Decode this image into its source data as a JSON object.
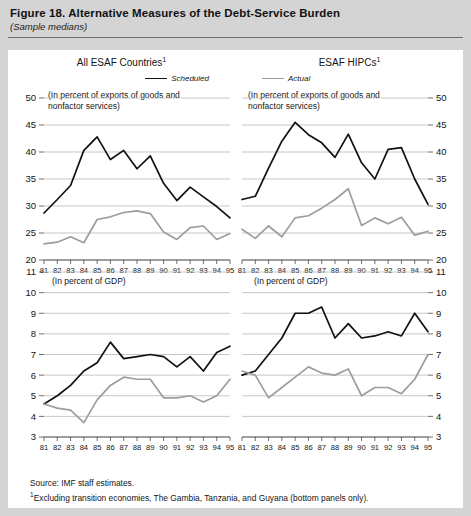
{
  "figure": {
    "title": "Figure 18. Alternative Measures of the Debt-Service Burden",
    "subtitle": "(Sample medians)",
    "source_note": "Source:  IMF staff estimates.",
    "footnote_marker": "1",
    "footnote": "Excluding transition economies, The Gambia, Tanzania, and Guyana (bottom panels only)."
  },
  "colors": {
    "scheduled": "#111111",
    "actual": "#9d9d9d",
    "gridline": "#b9b9b9",
    "page_background": "#d4d4d4",
    "panel_background": "#ffffff"
  },
  "legend": {
    "scheduled_label": "Scheduled",
    "actual_label": "Actual"
  },
  "panels": {
    "top_left": {
      "title": "All ESAF Countries",
      "title_superscript": "1",
      "units": "(In percent of exports of goods and\nnonfactor services)",
      "y_labels_side": "left"
    },
    "top_right": {
      "title": "ESAF HIPCs",
      "title_superscript": "1",
      "units": "(In percent of exports of goods and\nnonfactor services)",
      "y_labels_side": "right"
    },
    "bottom_left": {
      "title": "",
      "units": "(In percent of GDP)",
      "y_labels_side": "left"
    },
    "bottom_right": {
      "title": "",
      "units": "(In percent of GDP)",
      "y_labels_side": "right"
    }
  },
  "chart_data": [
    {
      "id": "top_left",
      "type": "line",
      "title": "All ESAF Countries",
      "subtitle": "(In percent of exports of goods and nonfactor services)",
      "xlabel": "",
      "ylabel": "",
      "x": [
        "81",
        "82",
        "83",
        "84",
        "85",
        "86",
        "87",
        "88",
        "89",
        "90",
        "91",
        "92",
        "93",
        "94",
        "95"
      ],
      "tick_labels": [
        "81",
        "82",
        "83",
        "84",
        "85",
        "86",
        "87",
        "88",
        "89",
        "90",
        "91",
        "92",
        "93",
        "94",
        "95"
      ],
      "ylim": [
        20,
        50
      ],
      "yticks": [
        20,
        25,
        30,
        35,
        40,
        45,
        50
      ],
      "grid": true,
      "legend_position": "top-right",
      "series": [
        {
          "name": "Scheduled",
          "color": "#111111",
          "values": [
            28.7,
            31.2,
            33.8,
            40.3,
            42.8,
            38.6,
            40.3,
            36.9,
            39.3,
            34.2,
            31.0,
            33.5,
            31.7,
            29.9,
            27.8
          ]
        },
        {
          "name": "Actual",
          "color": "#9d9d9d",
          "values": [
            23.0,
            23.3,
            24.3,
            23.2,
            27.5,
            28.0,
            28.8,
            29.1,
            28.6,
            25.2,
            23.8,
            26.0,
            26.3,
            23.8,
            24.9
          ]
        }
      ]
    },
    {
      "id": "top_right",
      "type": "line",
      "title": "ESAF HIPCs",
      "subtitle": "(In percent of exports of goods and nonfactor services)",
      "xlabel": "",
      "ylabel": "",
      "x": [
        "81",
        "82",
        "83",
        "84",
        "85",
        "86",
        "87",
        "88",
        "89",
        "90",
        "91",
        "92",
        "93",
        "94",
        "95"
      ],
      "tick_labels": [
        "81",
        "82",
        "83",
        "84",
        "85",
        "86",
        "87",
        "88",
        "89",
        "90",
        "91",
        "92",
        "93",
        "94",
        "95"
      ],
      "ylim": [
        20,
        50
      ],
      "yticks": [
        20,
        25,
        30,
        35,
        40,
        45,
        50
      ],
      "grid": true,
      "legend_position": "top-left",
      "series": [
        {
          "name": "Scheduled",
          "color": "#111111",
          "values": [
            31.2,
            31.8,
            37.0,
            42.0,
            45.5,
            43.2,
            41.7,
            39.0,
            43.3,
            38.0,
            35.0,
            40.5,
            40.8,
            35.0,
            30.3
          ]
        },
        {
          "name": "Actual",
          "color": "#9d9d9d",
          "values": [
            25.7,
            24.0,
            26.3,
            24.3,
            27.8,
            28.2,
            29.6,
            31.2,
            33.2,
            26.4,
            27.8,
            26.7,
            27.9,
            24.6,
            25.3
          ]
        }
      ]
    },
    {
      "id": "bottom_left",
      "type": "line",
      "title": "",
      "subtitle": "(In percent of GDP)",
      "xlabel": "",
      "ylabel": "",
      "x": [
        "81",
        "82",
        "83",
        "84",
        "85",
        "86",
        "87",
        "88",
        "89",
        "90",
        "91",
        "92",
        "93",
        "94",
        "95"
      ],
      "tick_labels": [
        "81",
        "82",
        "83",
        "84",
        "85",
        "86",
        "87",
        "88",
        "89",
        "90",
        "91",
        "92",
        "93",
        "94",
        "95"
      ],
      "ylim": [
        3,
        11
      ],
      "yticks": [
        3,
        4,
        5,
        6,
        7,
        8,
        9,
        10,
        11
      ],
      "grid": true,
      "legend_position": "none",
      "series": [
        {
          "name": "Scheduled",
          "color": "#111111",
          "values": [
            4.6,
            5.0,
            5.5,
            6.2,
            6.6,
            7.6,
            6.8,
            6.9,
            7.0,
            6.9,
            6.4,
            6.9,
            6.2,
            7.1,
            7.4
          ]
        },
        {
          "name": "Actual",
          "color": "#9d9d9d",
          "values": [
            4.6,
            4.4,
            4.3,
            3.7,
            4.8,
            5.5,
            5.9,
            5.8,
            5.8,
            4.9,
            4.9,
            5.0,
            4.7,
            5.0,
            5.8
          ]
        }
      ]
    },
    {
      "id": "bottom_right",
      "type": "line",
      "title": "",
      "subtitle": "(In percent of GDP)",
      "xlabel": "",
      "ylabel": "",
      "x": [
        "81",
        "82",
        "83",
        "84",
        "85",
        "86",
        "87",
        "88",
        "89",
        "90",
        "91",
        "92",
        "93",
        "94",
        "95"
      ],
      "tick_labels": [
        "81",
        "82",
        "83",
        "84",
        "85",
        "86",
        "87",
        "88",
        "89",
        "90",
        "91",
        "92",
        "93",
        "94",
        "95"
      ],
      "ylim": [
        3,
        11
      ],
      "yticks": [
        3,
        4,
        5,
        6,
        7,
        8,
        9,
        10,
        11
      ],
      "grid": true,
      "legend_position": "none",
      "series": [
        {
          "name": "Scheduled",
          "color": "#111111",
          "values": [
            6.0,
            6.2,
            7.0,
            7.8,
            9.0,
            9.0,
            9.3,
            7.8,
            8.5,
            7.8,
            7.9,
            8.1,
            7.9,
            9.0,
            8.1
          ]
        },
        {
          "name": "Actual",
          "color": "#9d9d9d",
          "values": [
            6.2,
            6.0,
            4.9,
            5.4,
            5.9,
            6.4,
            6.1,
            6.0,
            6.3,
            5.0,
            5.4,
            5.4,
            5.1,
            5.8,
            7.0
          ]
        }
      ]
    }
  ]
}
